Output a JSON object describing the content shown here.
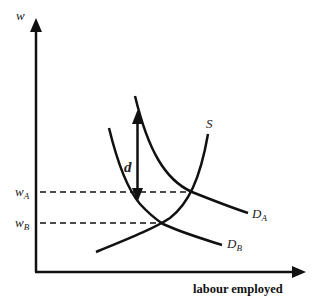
{
  "diagram": {
    "type": "labour market supply and demand",
    "axes": {
      "y_label": "w",
      "x_label": "labour employed"
    },
    "wage_levels": [
      {
        "id": "wA",
        "label_main": "w",
        "label_sub": "A"
      },
      {
        "id": "wB",
        "label_main": "w",
        "label_sub": "B"
      }
    ],
    "curves": {
      "supply": {
        "label": "S"
      },
      "demand_a": {
        "label_main": "D",
        "label_sub": "A"
      },
      "demand_b": {
        "label_main": "D",
        "label_sub": "B"
      }
    },
    "gap_label": "d",
    "colors": {
      "line": "#111111",
      "background": "#ffffff"
    }
  }
}
